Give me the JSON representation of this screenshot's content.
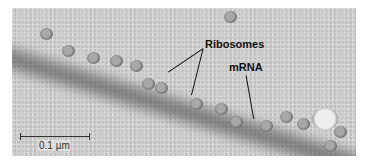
{
  "figure": {
    "labels": {
      "ribosomes": "Ribosomes",
      "mrna": "mRNA"
    },
    "scale_bar": {
      "label": "0.1 µm"
    }
  }
}
